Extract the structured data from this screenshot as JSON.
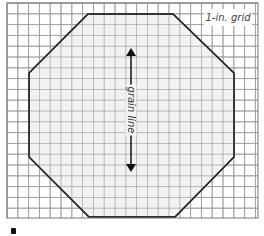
{
  "diagram": {
    "title_label": "1-in. grid",
    "grain_label": "grain line",
    "shape": "octagon",
    "grid": {
      "left": 7,
      "top": 3,
      "right": 258,
      "bottom": 218,
      "cell_size": 10.8,
      "line_color": "#9a9a9a",
      "border_color": "#777777"
    },
    "octagon_points": [
      [
        88,
        14
      ],
      [
        173,
        14
      ],
      [
        234,
        73
      ],
      [
        234,
        157
      ],
      [
        175,
        217
      ],
      [
        89,
        217
      ],
      [
        29,
        157
      ],
      [
        29,
        73
      ]
    ],
    "octagon_fill": "#f2f2f2",
    "octagon_stroke": "#222222",
    "grain_arrow": {
      "x": 131,
      "y1": 48,
      "y2": 172
    }
  }
}
